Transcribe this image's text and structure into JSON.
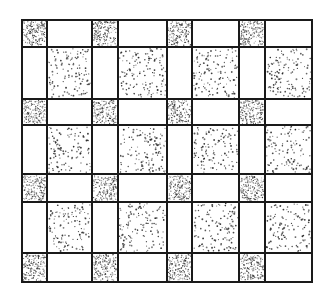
{
  "figure": {
    "width": 330,
    "height": 291,
    "background": "#ffffff",
    "line_color": "#1a1a1a",
    "line_width": 2,
    "x_lines": [
      22,
      47,
      92,
      118,
      167,
      192,
      239,
      265,
      312
    ],
    "y_lines": [
      20,
      47,
      99,
      125,
      174,
      202,
      253,
      282
    ],
    "column_types": [
      "narrow",
      "wide",
      "narrow",
      "wide",
      "narrow",
      "wide",
      "narrow",
      "wide"
    ],
    "row_types": [
      "narrow",
      "wide",
      "narrow",
      "wide",
      "narrow",
      "wide",
      "narrow"
    ],
    "fills": {
      "narrow_narrow": {
        "kind": "dense-stipple",
        "density": 0.3,
        "dot_radius": 0.55,
        "color": "#333333"
      },
      "wide_wide": {
        "kind": "sparse-dots",
        "density": 0.055,
        "dot_radius": 0.75,
        "color": "#2a2a2a"
      },
      "mixed": {
        "kind": "blank",
        "color": "#ffffff"
      }
    }
  }
}
